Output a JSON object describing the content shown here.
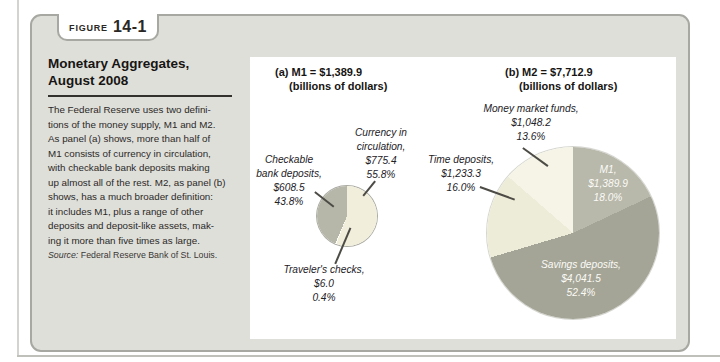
{
  "figure": {
    "tab_label": "FIGURE",
    "tab_number": "14-1"
  },
  "sidebar": {
    "title": "Monetary Aggregates,\nAugust 2008",
    "body": "The Federal Reserve uses two defini-\ntions of the money supply, M1 and M2.\nAs panel (a) shows, more than half of\nM1 consists of currency in circulation,\nwith checkable bank deposits making\nup almost all of the rest. M2, as panel (b)\nshows, has a much broader definition:\nit includes M1, plus a range of other\ndeposits and deposit-like assets, mak-\ning it more than five times as large.",
    "source_label": "Source:",
    "source_text": "Federal Reserve Bank of St. Louis."
  },
  "chart_data": [
    {
      "type": "pie",
      "title": "(a) M1 = $1,389.9",
      "subtitle": "(billions of dollars)",
      "total_label": "M1 = $1,389.9 billions of dollars",
      "legend": "none, direct callout labels",
      "slices": [
        {
          "label": "Currency in circulation",
          "callout_name": "Currency in\ncirculation,",
          "amount": 775.4,
          "amount_label": "$775.4",
          "pct": 55.8,
          "pct_label": "55.8%",
          "color": "#f1efdb"
        },
        {
          "label": "Traveler's checks",
          "callout_name": "Traveler's checks,",
          "amount": 6.0,
          "amount_label": "$6.0",
          "pct": 0.4,
          "pct_label": "0.4%",
          "color": "#fdfdf9",
          "min_render_deg": 2.2
        },
        {
          "label": "Checkable bank deposits",
          "callout_name": "Checkable\nbank deposits,",
          "amount": 608.5,
          "amount_label": "$608.5",
          "pct": 43.8,
          "pct_label": "43.8%",
          "color": "#b6b6a9"
        }
      ]
    },
    {
      "type": "pie",
      "title": "(b) M2 = $7,712.9",
      "subtitle": "(billions of dollars)",
      "total_label": "M2 = $7,712.9 billions of dollars",
      "legend": "none, direct callout labels",
      "slices": [
        {
          "label": "M1",
          "callout_name": "M1,",
          "amount": 1389.9,
          "amount_label": "$1,389.9",
          "pct": 18.0,
          "pct_label": "18.0%",
          "color": "#b8b8ab"
        },
        {
          "label": "Savings deposits",
          "callout_name": "Savings deposits,",
          "amount": 4041.5,
          "amount_label": "$4,041.5",
          "pct": 52.4,
          "pct_label": "52.4%",
          "color": "#a5a597"
        },
        {
          "label": "Time deposits",
          "callout_name": "Time deposits,",
          "amount": 1233.3,
          "amount_label": "$1,233.3",
          "pct": 16.0,
          "pct_label": "16.0%",
          "color": "#edecd9"
        },
        {
          "label": "Money market funds",
          "callout_name": "Money market funds,",
          "amount": 1048.2,
          "amount_label": "$1,048.2",
          "pct": 13.6,
          "pct_label": "13.6%",
          "color": "#f5f4e6"
        }
      ]
    }
  ]
}
